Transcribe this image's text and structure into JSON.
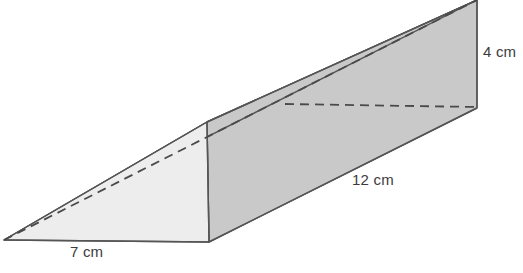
{
  "figure": {
    "name": "triangular-prism-wedge",
    "type": "geometric-solid-diagram",
    "colors": {
      "front_face_fill": "#ededed",
      "side_face_fill": "#c9c9c9",
      "top_face_fill": "#c9c9c9",
      "edge_stroke": "#555555",
      "hidden_edge_stroke": "#4a4a4a",
      "label_text": "#3c3c3c",
      "background": "#ffffff"
    },
    "labels": {
      "base": "7 cm",
      "length": "12 cm",
      "height": "4 cm"
    },
    "geometry": {
      "front_triangle": [
        [
          4,
          240
        ],
        [
          209,
          242
        ],
        [
          207,
          122
        ]
      ],
      "side_face": [
        [
          207,
          122
        ],
        [
          209,
          242
        ],
        [
          477,
          108
        ],
        [
          477,
          0
        ]
      ],
      "top_face": [
        [
          4,
          240
        ],
        [
          207,
          122
        ],
        [
          477,
          0
        ]
      ],
      "hidden_edges": [
        {
          "name": "diagonal-hidden-edge",
          "from": [
            4,
            240
          ],
          "to": [
            477,
            0
          ]
        },
        {
          "name": "horizontal-hidden-edge",
          "from": [
            285,
            104
          ],
          "to": [
            477,
            107
          ]
        }
      ],
      "vertical_edge": {
        "from": [
          207,
          122
        ],
        "to": [
          209,
          242
        ]
      },
      "right_edge": {
        "from": [
          477,
          0
        ],
        "to": [
          477,
          108
        ]
      }
    }
  }
}
